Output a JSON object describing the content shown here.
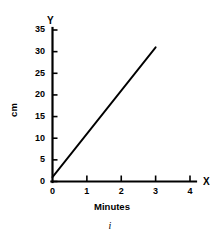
{
  "chart_data": {
    "type": "line",
    "title": "",
    "subtitle": "",
    "caption": "i",
    "xlabel": "Minutes",
    "ylabel": "cm",
    "x_axis_letter": "X",
    "y_axis_letter": "Y",
    "xlim": [
      0,
      4
    ],
    "ylim": [
      0,
      35
    ],
    "x_ticks": [
      0,
      1,
      2,
      3,
      4
    ],
    "x_tick_labels": [
      "0",
      "1",
      "2",
      "3",
      "4"
    ],
    "y_ticks": [
      0,
      5,
      10,
      15,
      20,
      25,
      30,
      35
    ],
    "y_tick_labels": [
      "0",
      "5",
      "10",
      "15",
      "20",
      "25",
      "30",
      "35"
    ],
    "grid": false,
    "legend": null,
    "series": [
      {
        "name": "distance",
        "x": [
          0,
          3
        ],
        "values": [
          1,
          31
        ],
        "color": "#000000"
      }
    ],
    "annotations": []
  },
  "style": {
    "background": "#ffffff",
    "ink": "#000000"
  }
}
